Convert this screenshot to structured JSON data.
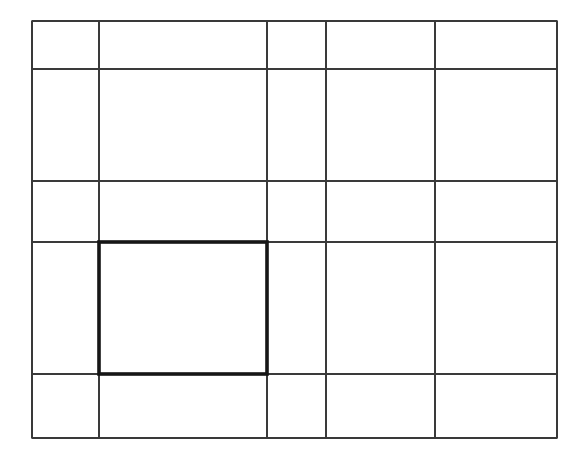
{
  "diagram": {
    "type": "grid",
    "background": "#ffffff",
    "line_color": "#3a3a3a",
    "highlight_color": "#161616",
    "bounds": {
      "x0": 32,
      "y0": 21,
      "x1": 557,
      "y1": 438
    },
    "vertical_lines_x": [
      32,
      99,
      267,
      326,
      435,
      557
    ],
    "horizontal_lines_y": [
      21,
      69,
      181,
      242,
      374,
      438
    ],
    "columns": 5,
    "rows": 5,
    "highlighted_cell": {
      "row": 4,
      "column": 2,
      "x": 99,
      "y": 242,
      "width": 168,
      "height": 132,
      "border_width": 3.6
    }
  }
}
